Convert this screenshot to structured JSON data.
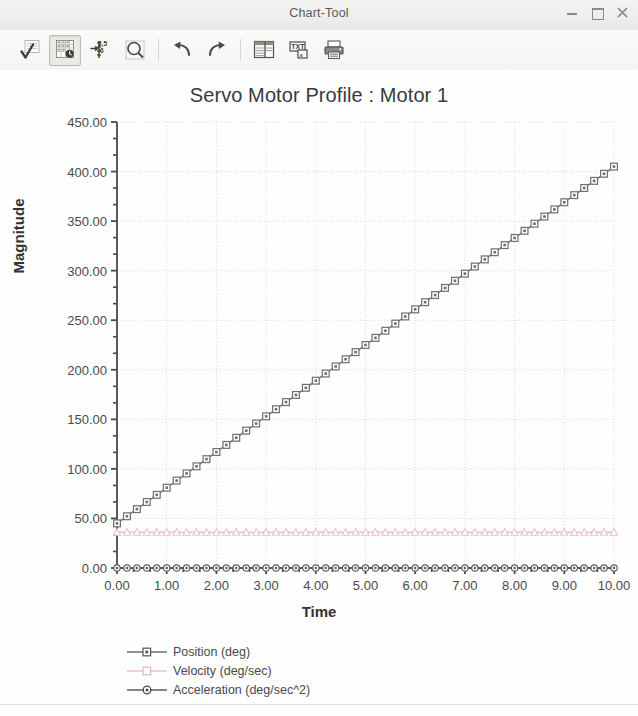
{
  "window": {
    "title": "Chart-Tool",
    "controls": [
      {
        "name": "minimize-button",
        "glyph": "minimize-icon"
      },
      {
        "name": "maximize-button",
        "glyph": "maximize-icon"
      },
      {
        "name": "close-button",
        "glyph": "close-icon"
      }
    ]
  },
  "toolbar": {
    "buttons": [
      {
        "name": "apply-check-button",
        "icon": "checkmark-grid-icon",
        "pressed": false
      },
      {
        "name": "data-table-button",
        "icon": "data-grid-clock-icon",
        "pressed": true
      },
      {
        "name": "axis-scale-button",
        "icon": "value-axis-icon",
        "pressed": false
      },
      {
        "name": "zoom-button",
        "icon": "magnifier-icon",
        "pressed": false
      },
      {
        "name": "undo-button",
        "icon": "undo-arrow-icon",
        "pressed": false
      },
      {
        "name": "redo-button",
        "icon": "redo-arrow-icon",
        "pressed": false
      },
      {
        "name": "layout-button",
        "icon": "table-layout-icon",
        "pressed": false
      },
      {
        "name": "text-properties-button",
        "icon": "text-box-icon",
        "pressed": false
      },
      {
        "name": "print-button",
        "icon": "printer-icon",
        "pressed": false
      }
    ]
  },
  "chart_data": {
    "type": "line",
    "title": "Servo Motor Profile : Motor 1",
    "xlabel": "Time",
    "ylabel": "Magnitude",
    "xlim": [
      0,
      10
    ],
    "ylim": [
      0,
      450
    ],
    "xticks": [
      0,
      1,
      2,
      3,
      4,
      5,
      6,
      7,
      8,
      9,
      10
    ],
    "xticklabels": [
      "0.00",
      "1.00",
      "2.00",
      "3.00",
      "4.00",
      "5.00",
      "6.00",
      "7.00",
      "8.00",
      "9.00",
      "10.00"
    ],
    "yticks": [
      0,
      50,
      100,
      150,
      200,
      250,
      300,
      350,
      400,
      450
    ],
    "yticklabels": [
      "0.00",
      "50.00",
      "100.00",
      "150.00",
      "200.00",
      "250.00",
      "300.00",
      "350.00",
      "400.00",
      "450.00"
    ],
    "minor_ticks_per_interval": 2,
    "grid": true,
    "grid_style": "dotted",
    "grid_color": "#d8d8d8",
    "legend_position": "bottom",
    "series": [
      {
        "name": "Position (deg)",
        "color": "#6e6e6e",
        "marker": "square",
        "x": [
          0.0,
          0.2,
          0.4,
          0.6,
          0.8,
          1.0,
          1.2,
          1.4,
          1.6,
          1.8,
          2.0,
          2.2,
          2.4,
          2.6,
          2.8,
          3.0,
          3.2,
          3.4,
          3.6,
          3.8,
          4.0,
          4.2,
          4.4,
          4.6,
          4.8,
          5.0,
          5.2,
          5.4,
          5.6,
          5.8,
          6.0,
          6.2,
          6.4,
          6.6,
          6.8,
          7.0,
          7.2,
          7.4,
          7.6,
          7.8,
          8.0,
          8.2,
          8.4,
          8.6,
          8.8,
          9.0,
          9.2,
          9.4,
          9.6,
          9.8,
          10.0
        ],
        "values": [
          45.0,
          52.2,
          59.4,
          66.6,
          73.8,
          81.0,
          88.2,
          95.4,
          102.6,
          109.8,
          117.0,
          124.2,
          131.4,
          138.6,
          145.8,
          153.0,
          160.2,
          167.4,
          174.6,
          181.8,
          189.0,
          196.2,
          203.4,
          210.6,
          217.8,
          225.0,
          232.2,
          239.4,
          246.6,
          253.8,
          261.0,
          268.2,
          275.4,
          282.6,
          289.8,
          297.0,
          304.2,
          311.4,
          318.6,
          325.8,
          333.0,
          340.2,
          347.4,
          354.6,
          361.8,
          369.0,
          376.2,
          383.4,
          390.6,
          397.8,
          405.0
        ]
      },
      {
        "name": "Velocity (deg/sec)",
        "color": "#e8c3cc",
        "marker": "triangle",
        "x": [
          0.0,
          0.2,
          0.4,
          0.6,
          0.8,
          1.0,
          1.2,
          1.4,
          1.6,
          1.8,
          2.0,
          2.2,
          2.4,
          2.6,
          2.8,
          3.0,
          3.2,
          3.4,
          3.6,
          3.8,
          4.0,
          4.2,
          4.4,
          4.6,
          4.8,
          5.0,
          5.2,
          5.4,
          5.6,
          5.8,
          6.0,
          6.2,
          6.4,
          6.6,
          6.8,
          7.0,
          7.2,
          7.4,
          7.6,
          7.8,
          8.0,
          8.2,
          8.4,
          8.6,
          8.8,
          9.0,
          9.2,
          9.4,
          9.6,
          9.8,
          10.0
        ],
        "values": [
          36.0,
          36.0,
          36.0,
          36.0,
          36.0,
          36.0,
          36.0,
          36.0,
          36.0,
          36.0,
          36.0,
          36.0,
          36.0,
          36.0,
          36.0,
          36.0,
          36.0,
          36.0,
          36.0,
          36.0,
          36.0,
          36.0,
          36.0,
          36.0,
          36.0,
          36.0,
          36.0,
          36.0,
          36.0,
          36.0,
          36.0,
          36.0,
          36.0,
          36.0,
          36.0,
          36.0,
          36.0,
          36.0,
          36.0,
          36.0,
          36.0,
          36.0,
          36.0,
          36.0,
          36.0,
          36.0,
          36.0,
          36.0,
          36.0,
          36.0,
          36.0
        ]
      },
      {
        "name": "Acceleration (deg/sec^2)",
        "color": "#5f5f5f",
        "marker": "circle",
        "x": [
          0.0,
          0.2,
          0.4,
          0.6,
          0.8,
          1.0,
          1.2,
          1.4,
          1.6,
          1.8,
          2.0,
          2.2,
          2.4,
          2.6,
          2.8,
          3.0,
          3.2,
          3.4,
          3.6,
          3.8,
          4.0,
          4.2,
          4.4,
          4.6,
          4.8,
          5.0,
          5.2,
          5.4,
          5.6,
          5.8,
          6.0,
          6.2,
          6.4,
          6.6,
          6.8,
          7.0,
          7.2,
          7.4,
          7.6,
          7.8,
          8.0,
          8.2,
          8.4,
          8.6,
          8.8,
          9.0,
          9.2,
          9.4,
          9.6,
          9.8,
          10.0
        ],
        "values": [
          0.0,
          0.0,
          0.0,
          0.0,
          0.0,
          0.0,
          0.0,
          0.0,
          0.0,
          0.0,
          0.0,
          0.0,
          0.0,
          0.0,
          0.0,
          0.0,
          0.0,
          0.0,
          0.0,
          0.0,
          0.0,
          0.0,
          0.0,
          0.0,
          0.0,
          0.0,
          0.0,
          0.0,
          0.0,
          0.0,
          0.0,
          0.0,
          0.0,
          0.0,
          0.0,
          0.0,
          0.0,
          0.0,
          0.0,
          0.0,
          0.0,
          0.0,
          0.0,
          0.0,
          0.0,
          0.0,
          0.0,
          0.0,
          0.0,
          0.0,
          0.0
        ]
      }
    ]
  }
}
